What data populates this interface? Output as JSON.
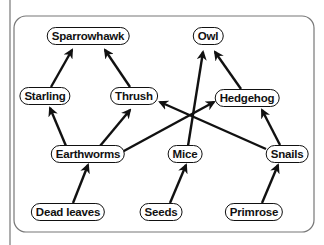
{
  "diagram": {
    "type": "food-web",
    "frame": {
      "left_rule_x": 10,
      "box": {
        "x": 14,
        "y": 16,
        "w": 300,
        "h": 216,
        "radius": 12
      }
    },
    "nodes": [
      {
        "id": "sparrowhawk",
        "label": "Sparrowhawk",
        "x": 88,
        "y": 36
      },
      {
        "id": "owl",
        "label": "Owl",
        "x": 208,
        "y": 36
      },
      {
        "id": "starling",
        "label": "Starling",
        "x": 45,
        "y": 96
      },
      {
        "id": "thrush",
        "label": "Thrush",
        "x": 134,
        "y": 96
      },
      {
        "id": "hedgehog",
        "label": "Hedgehog",
        "x": 247,
        "y": 98
      },
      {
        "id": "earthworms",
        "label": "Earthworms",
        "x": 88,
        "y": 154
      },
      {
        "id": "mice",
        "label": "Mice",
        "x": 185,
        "y": 154
      },
      {
        "id": "snails",
        "label": "Snails",
        "x": 287,
        "y": 154
      },
      {
        "id": "dead_leaves",
        "label": "Dead leaves",
        "x": 68,
        "y": 212
      },
      {
        "id": "seeds",
        "label": "Seeds",
        "x": 161,
        "y": 212
      },
      {
        "id": "primrose",
        "label": "Primrose",
        "x": 254,
        "y": 212
      }
    ],
    "edges": [
      {
        "from": "starling",
        "to": "sparrowhawk",
        "x1": 51,
        "y1": 87,
        "x2": 72,
        "y2": 50
      },
      {
        "from": "thrush",
        "to": "sparrowhawk",
        "x1": 130,
        "y1": 87,
        "x2": 105,
        "y2": 50
      },
      {
        "from": "hedgehog",
        "to": "owl",
        "x1": 241,
        "y1": 89,
        "x2": 215,
        "y2": 52
      },
      {
        "from": "mice",
        "to": "owl",
        "x1": 188,
        "y1": 146,
        "x2": 203,
        "y2": 52
      },
      {
        "from": "earthworms",
        "to": "starling",
        "x1": 66,
        "y1": 146,
        "x2": 50,
        "y2": 108
      },
      {
        "from": "earthworms",
        "to": "thrush",
        "x1": 100,
        "y1": 146,
        "x2": 130,
        "y2": 110
      },
      {
        "from": "earthworms",
        "to": "hedgehog",
        "x1": 122,
        "y1": 152,
        "x2": 214,
        "y2": 102
      },
      {
        "from": "snails",
        "to": "thrush",
        "x1": 266,
        "y1": 149,
        "x2": 160,
        "y2": 102
      },
      {
        "from": "snails",
        "to": "hedgehog",
        "x1": 280,
        "y1": 145,
        "x2": 262,
        "y2": 110
      },
      {
        "from": "dead_leaves",
        "to": "earthworms",
        "x1": 73,
        "y1": 203,
        "x2": 88,
        "y2": 165
      },
      {
        "from": "seeds",
        "to": "mice",
        "x1": 170,
        "y1": 203,
        "x2": 186,
        "y2": 165
      },
      {
        "from": "primrose",
        "to": "snails",
        "x1": 262,
        "y1": 203,
        "x2": 278,
        "y2": 165
      }
    ],
    "colors": {
      "line": "#111111",
      "frame": "#777777",
      "background": "#ffffff"
    }
  }
}
